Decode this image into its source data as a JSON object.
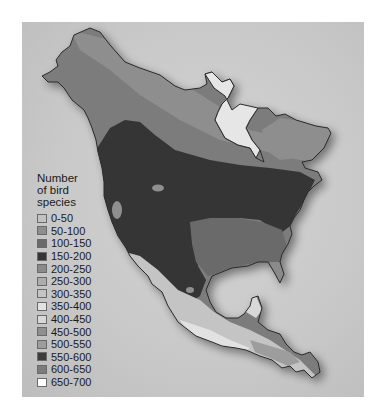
{
  "map": {
    "subject": "North America",
    "description": "Bird species richness across North America (grayscale choropleth)"
  },
  "legend": {
    "title": "Number of bird species",
    "title_lines": [
      "Number",
      "of bird",
      "species"
    ],
    "items": [
      {
        "label": "0-50",
        "color": "#c2c2c2"
      },
      {
        "label": "50-100",
        "color": "#8e8e8e"
      },
      {
        "label": "100-150",
        "color": "#6b6b6b"
      },
      {
        "label": "150-200",
        "color": "#353535"
      },
      {
        "label": "200-250",
        "color": "#8a8a8a"
      },
      {
        "label": "250-300",
        "color": "#acacac"
      },
      {
        "label": "300-350",
        "color": "#c4c4c4"
      },
      {
        "label": "350-400",
        "color": "#e2e2e2"
      },
      {
        "label": "400-450",
        "color": "#d8d8d8"
      },
      {
        "label": "450-500",
        "color": "#8f8f8f"
      },
      {
        "label": "500-550",
        "color": "#9d9d9d"
      },
      {
        "label": "550-600",
        "color": "#3c3c3c"
      },
      {
        "label": "600-650",
        "color": "#7c7c7c"
      },
      {
        "label": "650-700",
        "color": "#ffffff"
      }
    ]
  }
}
